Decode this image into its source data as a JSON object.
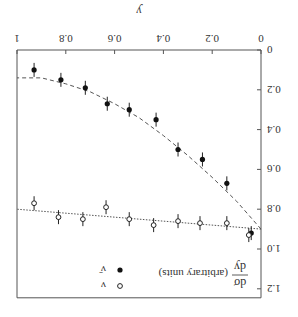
{
  "chart_data": {
    "type": "scatter",
    "title": "",
    "orientation_note": "figure rendered rotated 180 degrees",
    "xlabel": "y",
    "ylabel": "dσ/dy (arbitrary units)",
    "ylabel_num": "dσ",
    "ylabel_den": "dy",
    "ylabel_suffix": "(arbitrary units)",
    "xlim": [
      0,
      1
    ],
    "ylim": [
      0,
      1.2
    ],
    "x_ticks": [
      "0",
      "0.2",
      "0.4",
      "0.6",
      "0.8",
      "1"
    ],
    "y_ticks": [
      "0",
      "0.2",
      "0.4",
      "0.6",
      "0.8",
      "1.0",
      "1.2"
    ],
    "grid": false,
    "legend": {
      "position": "upper-left (as unrotated)",
      "entries": [
        {
          "label": "ν",
          "marker": "open-circle"
        },
        {
          "label": "ν̄",
          "marker": "filled-circle"
        }
      ]
    },
    "series": [
      {
        "name": "ν̄",
        "marker": "filled-circle",
        "x": [
          0.04,
          0.14,
          0.24,
          0.34,
          0.43,
          0.54,
          0.63,
          0.72,
          0.82,
          0.93
        ],
        "values": [
          0.92,
          0.67,
          0.55,
          0.5,
          0.35,
          0.3,
          0.27,
          0.19,
          0.15,
          0.1
        ],
        "fit": {
          "style": "dashed",
          "shape": "(1-y)^2 like",
          "x": [
            0,
            0.1,
            0.2,
            0.3,
            0.4,
            0.5,
            0.6,
            0.7,
            0.8,
            0.9,
            1.0
          ],
          "y": [
            0.9,
            0.76,
            0.64,
            0.53,
            0.43,
            0.34,
            0.27,
            0.21,
            0.17,
            0.14,
            0.14
          ]
        }
      },
      {
        "name": "ν",
        "marker": "open-circle",
        "x": [
          0.05,
          0.14,
          0.25,
          0.34,
          0.44,
          0.54,
          0.635,
          0.73,
          0.83,
          0.93
        ],
        "values": [
          0.93,
          0.87,
          0.87,
          0.86,
          0.88,
          0.85,
          0.79,
          0.85,
          0.84,
          0.77
        ],
        "fit": {
          "style": "dotted",
          "shape": "linear",
          "x": [
            0,
            1
          ],
          "y": [
            0.9,
            0.8
          ]
        }
      }
    ]
  }
}
